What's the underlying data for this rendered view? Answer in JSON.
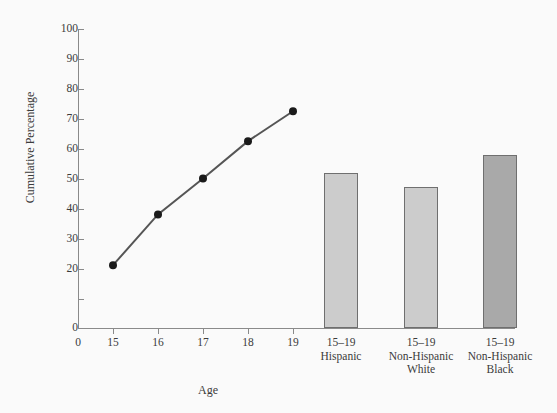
{
  "chart_data": {
    "type": "line",
    "title": "",
    "xlabel": "Age",
    "ylabel": "Cumulative Percentage",
    "ylim": [
      0,
      100
    ],
    "y_ticks": [
      0,
      10,
      20,
      30,
      40,
      50,
      60,
      70,
      80,
      90,
      100
    ],
    "y_tick_labels": [
      "0",
      "10",
      "20",
      "30",
      "40",
      "50",
      "60",
      "70",
      "80",
      "90",
      "100"
    ],
    "grid": false,
    "legend": "none",
    "x_axis_origin_label": "0",
    "series": [
      {
        "name": "Cumulative percentage by age",
        "type": "line",
        "marker": "filled-circle",
        "color": "#555555",
        "x": [
          15,
          16,
          17,
          18,
          19
        ],
        "x_labels": [
          "15",
          "16",
          "17",
          "18",
          "19"
        ],
        "values": [
          21,
          38,
          50,
          62.5,
          72.5
        ]
      },
      {
        "name": "Cumulative percentage by race/ethnicity, ages 15-19",
        "type": "bar",
        "categories": [
          "15–19\nHispanic",
          "15–19\nNon-Hispanic\nWhite",
          "15–19\nNon-Hispanic\nBlack"
        ],
        "category_lines": [
          [
            "15–19",
            "Hispanic"
          ],
          [
            "15–19",
            "Non-Hispanic",
            "White"
          ],
          [
            "15–19",
            "Non-Hispanic",
            "Black"
          ]
        ],
        "values": [
          52,
          47,
          58
        ],
        "colors": [
          "#cccccc",
          "#cccccc",
          "#a9a9a9"
        ]
      }
    ]
  },
  "figure": {
    "background": "#fafafa",
    "axis_color": "#8a8a8a",
    "text_color": "#3b3b3b",
    "line_color": "#555555",
    "marker_color": "#1a1a1a",
    "bar_light": "#cccccc",
    "bar_dark": "#a9a9a9",
    "bar_edge": "#6f6f6f"
  }
}
